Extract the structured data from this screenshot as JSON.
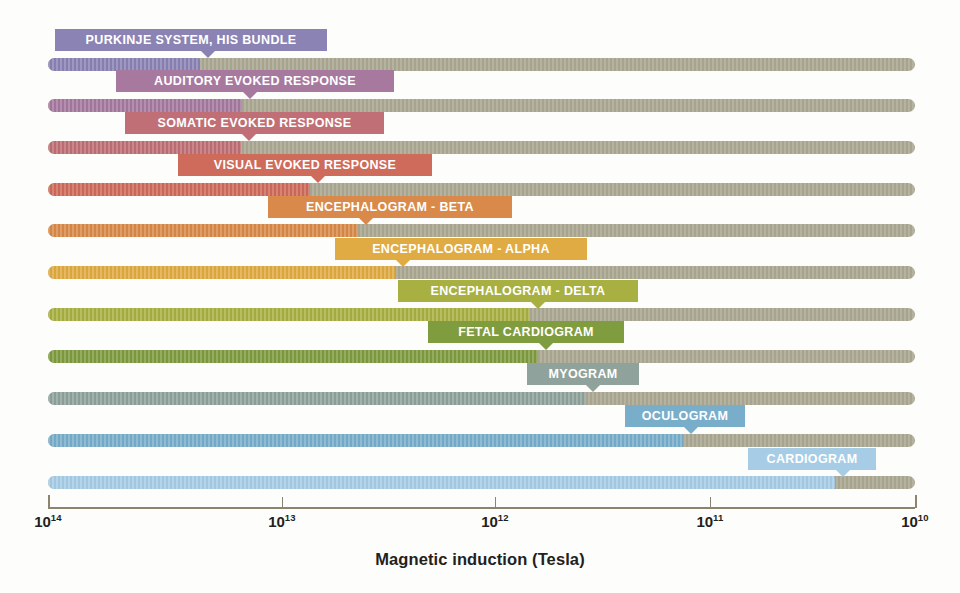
{
  "chart_data": {
    "type": "bar",
    "title": "",
    "xlabel": "Magnetic induction (Tesla)",
    "ylabel": "",
    "orientation": "horizontal",
    "scale": "log",
    "xlim": [
      "10^14",
      "10^10"
    ],
    "xticks": [
      "10^14",
      "10^13",
      "10^12",
      "10^11",
      "10^10"
    ],
    "xtick_bases": [
      "10",
      "10",
      "10",
      "10",
      "10"
    ],
    "xtick_exponents": [
      "14",
      "13",
      "12",
      "11",
      "10"
    ],
    "grid": false,
    "legend": "none",
    "note": "Each row is a full-width track (tan) with a colored segment from the left axis start up to that signal's magnetic induction amplitude; the callout label points at the segment end.",
    "categories": [
      "PURKINJE SYSTEM, HIS BUNDLE",
      "AUDITORY EVOKED RESPONSE",
      "SOMATIC EVOKED RESPONSE",
      "VISUAL EVOKED RESPONSE",
      "ENCEPHALOGRAM - BETA",
      "ENCEPHALOGRAM - ALPHA",
      "ENCEPHALOGRAM - DELTA",
      "FETAL CARDIOGRAM",
      "MYOGRAM",
      "OCULOGRAM",
      "CARDIOGRAM"
    ],
    "values_tesla": [
      3e-14,
      1.4e-13,
      1.4e-13,
      7e-13,
      2.2e-12,
      4.5e-12,
      3e-11,
      3.5e-11,
      1.1e-10,
      9e-10,
      1.6e-10
    ],
    "colors": [
      "#8b83b4",
      "#a7799f",
      "#bf6f75",
      "#cf6b5a",
      "#d98a4a",
      "#e0ab43",
      "#a9b042",
      "#7f9c3f",
      "#8fa39c",
      "#79aecb",
      "#a7cde6"
    ],
    "track_color": "#aba893",
    "series": [
      {
        "name": "PURKINJE SYSTEM, HIS BUNDLE",
        "fill_pct": 17.5,
        "color": "#8b83b4"
      },
      {
        "name": "AUDITORY EVOKED RESPONSE",
        "fill_pct": 22.4,
        "color": "#a7799f"
      },
      {
        "name": "SOMATIC EVOKED RESPONSE",
        "fill_pct": 22.3,
        "color": "#bf6f75"
      },
      {
        "name": "VISUAL EVOKED RESPONSE",
        "fill_pct": 30.2,
        "color": "#cf6b5a"
      },
      {
        "name": "ENCEPHALOGRAM - BETA",
        "fill_pct": 35.8,
        "color": "#d98a4a"
      },
      {
        "name": "ENCEPHALOGRAM - ALPHA",
        "fill_pct": 40.0,
        "color": "#e0ab43"
      },
      {
        "name": "ENCEPHALOGRAM - DELTA",
        "fill_pct": 55.6,
        "color": "#a9b042"
      },
      {
        "name": "FETAL CARDIOGRAM",
        "fill_pct": 56.5,
        "color": "#7f9c3f"
      },
      {
        "name": "MYOGRAM",
        "fill_pct": 61.9,
        "color": "#8fa39c"
      },
      {
        "name": "OCULOGRAM",
        "fill_pct": 73.2,
        "color": "#79aecb"
      },
      {
        "name": "CARDIOGRAM",
        "fill_pct": 90.8,
        "color": "#a7cde6"
      }
    ]
  },
  "rows": [
    {
      "label": "PURKINJE SYSTEM, HIS BUNDLE",
      "color": "#8b83b4",
      "bar_y": 58,
      "fill_w": 152,
      "label_x": 55,
      "label_y": 29,
      "label_w": 272,
      "tail_x": 145
    },
    {
      "label": "AUDITORY EVOKED RESPONSE",
      "color": "#a7799f",
      "bar_y": 99,
      "fill_w": 194,
      "label_x": 116,
      "label_y": 70,
      "label_w": 278,
      "tail_x": 126
    },
    {
      "label": "SOMATIC EVOKED RESPONSE",
      "color": "#bf6f75",
      "bar_y": 141,
      "fill_w": 193,
      "label_x": 125,
      "label_y": 112,
      "label_w": 259,
      "tail_x": 116
    },
    {
      "label": "VISUAL EVOKED RESPONSE",
      "color": "#cf6b5a",
      "bar_y": 183,
      "fill_w": 262,
      "label_x": 178,
      "label_y": 154,
      "label_w": 254,
      "tail_x": 132
    },
    {
      "label": "ENCEPHALOGRAM - BETA",
      "color": "#d98a4a",
      "bar_y": 224,
      "fill_w": 310,
      "label_x": 268,
      "label_y": 196,
      "label_w": 244,
      "tail_x": 90
    },
    {
      "label": "ENCEPHALOGRAM - ALPHA",
      "color": "#e0ab43",
      "bar_y": 266,
      "fill_w": 347,
      "label_x": 335,
      "label_y": 238,
      "label_w": 252,
      "tail_x": 60
    },
    {
      "label": "ENCEPHALOGRAM - DELTA",
      "color": "#a9b042",
      "bar_y": 308,
      "fill_w": 482,
      "label_x": 398,
      "label_y": 280,
      "label_w": 240,
      "tail_x": 132
    },
    {
      "label": "FETAL CARDIOGRAM",
      "color": "#7f9c3f",
      "bar_y": 350,
      "fill_w": 490,
      "label_x": 428,
      "label_y": 321,
      "label_w": 196,
      "tail_x": 110
    },
    {
      "label": "MYOGRAM",
      "color": "#8fa39c",
      "bar_y": 392,
      "fill_w": 537,
      "label_x": 527,
      "label_y": 363,
      "label_w": 112,
      "tail_x": 58
    },
    {
      "label": "OCULOGRAM",
      "color": "#79aecb",
      "bar_y": 434,
      "fill_w": 635,
      "label_x": 625,
      "label_y": 405,
      "label_w": 120,
      "tail_x": 58
    },
    {
      "label": "CARDIOGRAM",
      "color": "#a7cde6",
      "bar_y": 476,
      "fill_w": 787,
      "label_x": 748,
      "label_y": 448,
      "label_w": 128,
      "tail_x": 87
    }
  ],
  "axis": {
    "title": "Magnetic induction (Tesla)",
    "left_px": 48,
    "width_px": 867,
    "ticks": [
      {
        "base": "10",
        "exp": "14",
        "x": 48
      },
      {
        "base": "10",
        "exp": "13",
        "x": 282
      },
      {
        "base": "10",
        "exp": "12",
        "x": 495
      },
      {
        "base": "10",
        "exp": "11",
        "x": 710
      },
      {
        "base": "10",
        "exp": "10",
        "x": 915
      }
    ]
  }
}
